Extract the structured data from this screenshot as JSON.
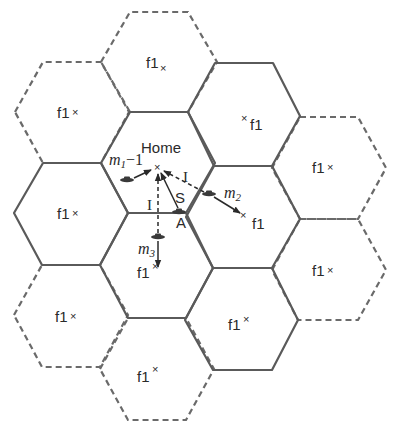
{
  "diagram": {
    "type": "hexagonal cellular layout",
    "colors": {
      "cell_line": "#5a5a5a",
      "text": "#2a2a2a",
      "background": "#ffffff"
    },
    "home_cell": {
      "label": "Home",
      "marker": "×"
    },
    "cells": [
      {
        "id": "top",
        "style": "dashed",
        "label": "f1",
        "marker": "×"
      },
      {
        "id": "upper-left",
        "style": "dashed",
        "label": "f1",
        "marker": "×"
      },
      {
        "id": "upper-right",
        "style": "solid",
        "label": "f1",
        "marker": "×"
      },
      {
        "id": "left",
        "style": "solid",
        "label": "f1",
        "marker": "×"
      },
      {
        "id": "far-right-upper",
        "style": "dashed",
        "label": "f1",
        "marker": "×"
      },
      {
        "id": "right-middle",
        "style": "solid",
        "label": "f1",
        "marker": "×"
      },
      {
        "id": "lower-center",
        "style": "solid",
        "label": "f1",
        "marker": "×"
      },
      {
        "id": "far-right-lower",
        "style": "dashed",
        "label": "f1",
        "marker": "×"
      },
      {
        "id": "lower-left",
        "style": "dashed",
        "label": "f1",
        "marker": "×"
      },
      {
        "id": "lower-right",
        "style": "solid",
        "label": "f1",
        "marker": "×"
      },
      {
        "id": "bottom",
        "style": "dashed",
        "label": "f1",
        "marker": "×"
      }
    ],
    "mobiles": [
      {
        "id": "m1",
        "label_main": "m",
        "label_sub": "1",
        "label_suffix": "−1"
      },
      {
        "id": "m2",
        "label_main": "m",
        "label_sub": "2"
      },
      {
        "id": "m3",
        "label_main": "m",
        "label_sub": "3"
      },
      {
        "id": "A",
        "label": "A"
      }
    ],
    "signals": {
      "interference_label": "I",
      "signal_label": "S"
    }
  }
}
